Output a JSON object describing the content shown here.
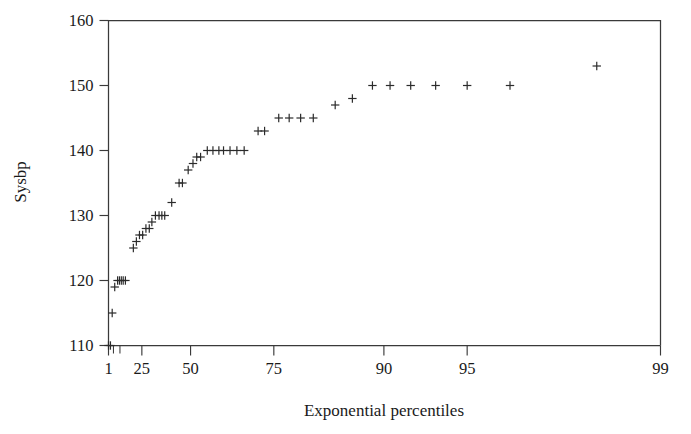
{
  "chart_data": {
    "type": "scatter",
    "title": "",
    "subtitle": "",
    "xlabel": "Exponential percentiles",
    "ylabel": "Sysbp",
    "marker": "plus",
    "marker_color": "#2b2b2b",
    "grid": false,
    "legend": null,
    "xscale": "exponential-probability",
    "xlim": [
      1,
      99
    ],
    "ylim": [
      110,
      160
    ],
    "xticks": [
      1,
      25,
      50,
      75,
      90,
      95,
      99
    ],
    "xticklabels": [
      "1",
      "25",
      "50",
      "75",
      "90",
      "95",
      "99"
    ],
    "x_minor_ticks": [
      5,
      10
    ],
    "yticks": [
      110,
      120,
      130,
      140,
      150,
      160
    ],
    "yticklabels": [
      "110",
      "120",
      "130",
      "140",
      "150",
      "160"
    ],
    "n_points": 57,
    "points": [
      {
        "x": 1.0,
        "y": 110
      },
      {
        "x": 2.6,
        "y": 110
      },
      {
        "x": 4.0,
        "y": 115
      },
      {
        "x": 6.0,
        "y": 119
      },
      {
        "x": 8.2,
        "y": 120
      },
      {
        "x": 9.6,
        "y": 120
      },
      {
        "x": 11.0,
        "y": 120
      },
      {
        "x": 12.4,
        "y": 120
      },
      {
        "x": 14.0,
        "y": 120
      },
      {
        "x": 19.5,
        "y": 125
      },
      {
        "x": 21.5,
        "y": 126
      },
      {
        "x": 23.5,
        "y": 127
      },
      {
        "x": 25.5,
        "y": 127
      },
      {
        "x": 27.5,
        "y": 128
      },
      {
        "x": 29.5,
        "y": 128
      },
      {
        "x": 31.0,
        "y": 129
      },
      {
        "x": 33.0,
        "y": 130
      },
      {
        "x": 35.0,
        "y": 130
      },
      {
        "x": 36.5,
        "y": 130
      },
      {
        "x": 38.0,
        "y": 130
      },
      {
        "x": 41.5,
        "y": 132
      },
      {
        "x": 45.0,
        "y": 135
      },
      {
        "x": 46.5,
        "y": 135
      },
      {
        "x": 49.0,
        "y": 137
      },
      {
        "x": 51.0,
        "y": 138
      },
      {
        "x": 52.5,
        "y": 139
      },
      {
        "x": 54.0,
        "y": 139
      },
      {
        "x": 56.5,
        "y": 140
      },
      {
        "x": 58.5,
        "y": 140
      },
      {
        "x": 60.5,
        "y": 140
      },
      {
        "x": 62.0,
        "y": 140
      },
      {
        "x": 64.0,
        "y": 140
      },
      {
        "x": 66.0,
        "y": 140
      },
      {
        "x": 68.0,
        "y": 140
      },
      {
        "x": 71.5,
        "y": 143
      },
      {
        "x": 73.0,
        "y": 143
      },
      {
        "x": 76.0,
        "y": 145
      },
      {
        "x": 78.0,
        "y": 145
      },
      {
        "x": 80.0,
        "y": 145
      },
      {
        "x": 82.0,
        "y": 145
      },
      {
        "x": 85.0,
        "y": 147
      },
      {
        "x": 87.0,
        "y": 148
      },
      {
        "x": 89.0,
        "y": 150
      },
      {
        "x": 90.5,
        "y": 150
      },
      {
        "x": 92.0,
        "y": 150
      },
      {
        "x": 93.5,
        "y": 150
      },
      {
        "x": 95.0,
        "y": 150
      },
      {
        "x": 96.5,
        "y": 150
      },
      {
        "x": 98.3,
        "y": 153
      }
    ]
  },
  "axes": {
    "y_title": "Sysbp",
    "x_title": "Exponential percentiles"
  }
}
